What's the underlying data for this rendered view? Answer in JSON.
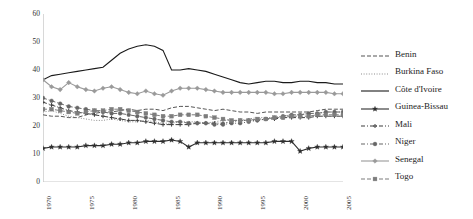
{
  "chart_data": {
    "type": "line",
    "title": "",
    "subtitle": "",
    "xlabel": "",
    "ylabel": "",
    "xlim": [
      1970,
      2005
    ],
    "ylim": [
      0,
      60
    ],
    "yticks": [
      0,
      10,
      20,
      30,
      40,
      50,
      60
    ],
    "xticks": [
      "1970",
      "1975",
      "1980",
      "1985",
      "1990",
      "1995",
      "2000",
      "2005"
    ],
    "grid": false,
    "legend_position": "right",
    "x": [
      1970,
      1971,
      1972,
      1973,
      1974,
      1975,
      1976,
      1977,
      1978,
      1979,
      1980,
      1981,
      1982,
      1983,
      1984,
      1985,
      1986,
      1987,
      1988,
      1989,
      1990,
      1991,
      1992,
      1993,
      1994,
      1995,
      1996,
      1997,
      1998,
      1999,
      2000,
      2001,
      2002,
      2003,
      2004,
      2005
    ],
    "series": [
      {
        "name": "Benin",
        "color": "#555555",
        "line_style": "dashed",
        "marker": "none",
        "values": [
          24,
          23.5,
          23.5,
          23,
          23,
          24,
          24.5,
          25,
          25,
          25.5,
          26,
          25.5,
          26,
          26,
          25.5,
          26.5,
          27,
          27,
          26.5,
          26,
          25.5,
          26,
          25.5,
          25,
          25,
          24.5,
          25,
          25,
          25,
          25,
          25,
          25,
          25.5,
          26,
          26,
          26
        ]
      },
      {
        "name": "Burkina Faso",
        "color": "#8c8c8c",
        "line_style": "dotted",
        "marker": "none",
        "values": [
          25,
          25.5,
          24.5,
          23.5,
          23,
          22.5,
          22,
          22,
          22.5,
          22,
          21.5,
          21.5,
          22,
          21.5,
          21,
          21,
          21.5,
          21.5,
          21.5,
          21,
          21.5,
          22,
          22,
          22,
          22.5,
          23,
          23,
          23,
          23.5,
          24,
          24,
          24.5,
          24.5,
          25,
          25,
          25
        ]
      },
      {
        "name": "Côte d'Ivoire",
        "color": "#1a1a1a",
        "line_style": "solid",
        "marker": "none",
        "values": [
          36.5,
          38,
          38.5,
          39,
          39.5,
          40,
          40.5,
          41,
          43.5,
          46,
          47.5,
          48.5,
          49,
          48.5,
          47,
          40,
          40,
          40.5,
          40,
          39.5,
          38.5,
          37.5,
          36.5,
          35.5,
          35,
          35.5,
          36,
          36,
          35.5,
          35.5,
          36,
          36,
          35.5,
          35.5,
          35,
          35
        ]
      },
      {
        "name": "Guinea-Bissau",
        "color": "#2e2e2e",
        "line_style": "solid",
        "marker": "star",
        "values": [
          12,
          12.5,
          12.5,
          12.5,
          12.5,
          13,
          13,
          13,
          13.5,
          13.5,
          14,
          14,
          14.5,
          14.5,
          14.5,
          15,
          14.5,
          12.5,
          14,
          14,
          14,
          14,
          14,
          14,
          14,
          14,
          14,
          14.5,
          14.5,
          14.5,
          11,
          12,
          12.5,
          12.5,
          12.5,
          12.5
        ]
      },
      {
        "name": "Mali",
        "color": "#3d3d3d",
        "line_style": "dashdot",
        "marker": "plus",
        "values": [
          28.5,
          27.5,
          26.5,
          25.5,
          25,
          24.5,
          24,
          23.5,
          23,
          22.5,
          22,
          22,
          21.5,
          21,
          20.5,
          20.5,
          20.5,
          20.5,
          21,
          21,
          21,
          21,
          21.5,
          22,
          22,
          22,
          22.5,
          22.5,
          23,
          23,
          23,
          23,
          23.5,
          23.5,
          23.5,
          23.5
        ]
      },
      {
        "name": "Niger",
        "color": "#666666",
        "line_style": "dashdot",
        "marker": "circle",
        "values": [
          30,
          29,
          28,
          27,
          26.5,
          26,
          25.5,
          25,
          24.5,
          24.5,
          24,
          23.5,
          23,
          22.5,
          22,
          21.5,
          21.5,
          21,
          21,
          21,
          20.5,
          20.5,
          21,
          21,
          21.5,
          22,
          22.5,
          23,
          23.5,
          24,
          24,
          24.5,
          24.5,
          25,
          25,
          25
        ]
      },
      {
        "name": "Senegal",
        "color": "#9a9a9a",
        "line_style": "solid",
        "marker": "diamond",
        "values": [
          36.5,
          34,
          33,
          35.5,
          34,
          33,
          32.5,
          33.5,
          34,
          33,
          32,
          31.5,
          32.5,
          31.5,
          31,
          32.5,
          33.5,
          33.5,
          33.5,
          33,
          32.5,
          32,
          32,
          32,
          32,
          32,
          32,
          31.5,
          31.5,
          32,
          32,
          32,
          32,
          32,
          31.5,
          31.5
        ]
      },
      {
        "name": "Togo",
        "color": "#7d7d7d",
        "line_style": "dashed",
        "marker": "square",
        "values": [
          26,
          26,
          25.5,
          25,
          24.5,
          25,
          25.5,
          25.5,
          26,
          26,
          25.5,
          25,
          24.5,
          24,
          23.5,
          23.5,
          24,
          24,
          24,
          23.5,
          23,
          22.5,
          22,
          22,
          22,
          22.5,
          22.5,
          23,
          23,
          23.5,
          23.5,
          23.5,
          24,
          24,
          24,
          24
        ]
      }
    ]
  }
}
